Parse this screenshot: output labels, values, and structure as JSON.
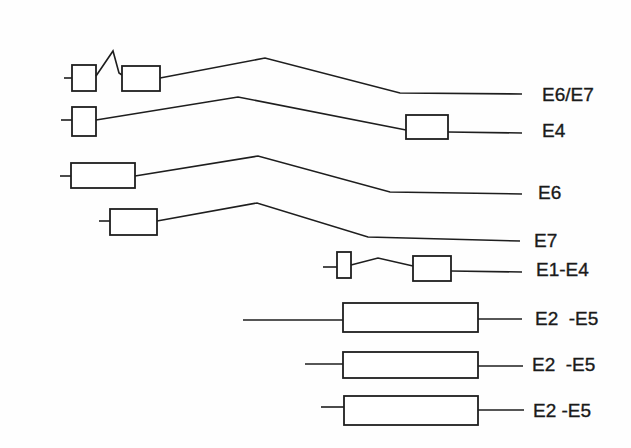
{
  "diagram": {
    "rows": [
      {
        "label": "E6/E7",
        "structure": [
          "stub",
          "exon",
          "splice-junction",
          "exon",
          "intron"
        ]
      },
      {
        "label": "E4",
        "structure": [
          "stub",
          "exon",
          "intron",
          "exon",
          "tail"
        ]
      },
      {
        "label": "E6",
        "structure": [
          "stub",
          "exon",
          "intron"
        ]
      },
      {
        "label": "E7",
        "structure": [
          "stub",
          "exon",
          "intron"
        ]
      },
      {
        "label": "E1-E4",
        "structure": [
          "stub",
          "exon",
          "splice-junction",
          "exon",
          "tail"
        ]
      },
      {
        "label": "E2  -E5",
        "structure": [
          "lead",
          "exon",
          "tail"
        ]
      },
      {
        "label": "E2  -E5",
        "structure": [
          "lead",
          "exon",
          "tail"
        ]
      },
      {
        "label": "E2 -E5",
        "structure": [
          "lead",
          "exon",
          "tail"
        ]
      }
    ]
  }
}
